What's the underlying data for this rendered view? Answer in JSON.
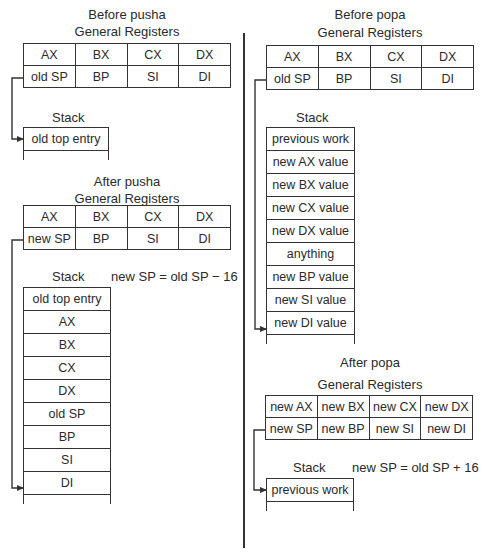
{
  "panels": {
    "before_pusha": {
      "title": "Before pusha",
      "registers_label": "General Registers",
      "registers": [
        [
          "AX",
          "BX",
          "CX",
          "DX"
        ],
        [
          "old SP",
          "BP",
          "SI",
          "DI"
        ]
      ],
      "stack_label": "Stack",
      "stack": [
        "old top entry"
      ]
    },
    "after_pusha": {
      "title": "After pusha",
      "registers_label": "General Registers",
      "registers": [
        [
          "AX",
          "BX",
          "CX",
          "DX"
        ],
        [
          "new SP",
          "BP",
          "SI",
          "DI"
        ]
      ],
      "stack_label": "Stack",
      "equation": "new SP = old SP  − 16",
      "stack": [
        "old top entry",
        "AX",
        "BX",
        "CX",
        "DX",
        "old SP",
        "BP",
        "SI",
        "DI"
      ]
    },
    "before_popa": {
      "title": "Before popa",
      "registers_label": "General Registers",
      "registers": [
        [
          "AX",
          "BX",
          "CX",
          "DX"
        ],
        [
          "old SP",
          "BP",
          "SI",
          "DI"
        ]
      ],
      "stack_label": "Stack",
      "stack": [
        "previous work",
        "new AX value",
        "new BX value",
        "new CX value",
        "new DX value",
        "anything",
        "new BP value",
        "new SI value",
        "new DI value"
      ]
    },
    "after_popa": {
      "title": "After popa",
      "registers_label": "General Registers",
      "registers": [
        [
          "new AX",
          "new BX",
          "new CX",
          "new DX"
        ],
        [
          "new SP",
          "new BP",
          "new SI",
          "new DI"
        ]
      ],
      "stack_label": "Stack",
      "equation": "new SP = old SP + 16",
      "stack": [
        "previous work"
      ]
    }
  },
  "icons": {
    "pointer_arrow": "arrow-right"
  },
  "colors": {
    "line": "#333333",
    "text": "#2a2a2a",
    "background": "#ffffff"
  }
}
